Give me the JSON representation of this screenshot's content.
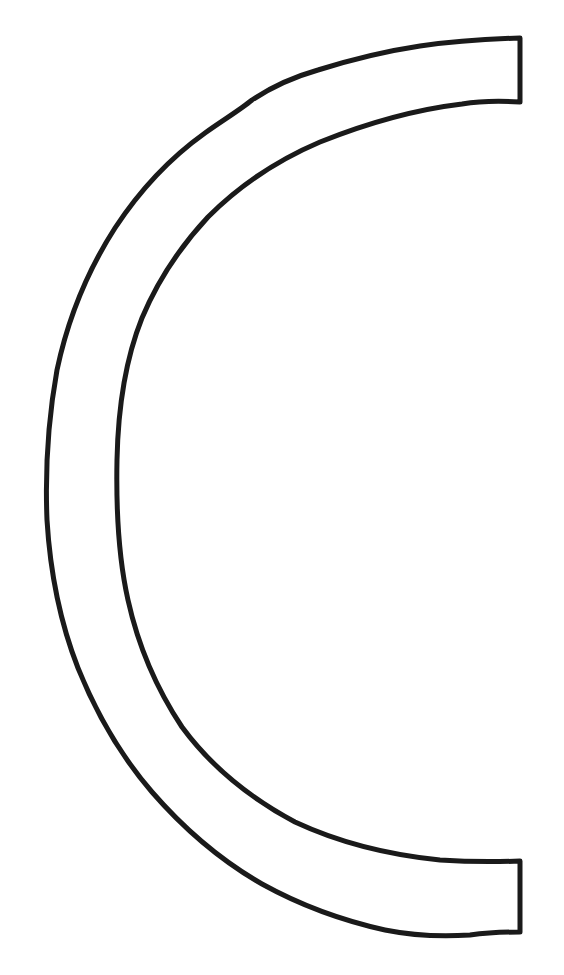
{
  "figure": {
    "description": "Outlined C-shaped semicircular band (coloring-page style line art)",
    "shape": "c-shape-band",
    "stroke_color": "#1a1a1a",
    "fill_color": "#ffffff",
    "background_color": "#ffffff",
    "stroke_width": 5,
    "outer_top_corner": [
      520,
      38
    ],
    "outer_bottom_corner": [
      520,
      932
    ],
    "inner_top_corner": [
      520,
      100
    ],
    "inner_bottom_corner": [
      520,
      862
    ]
  }
}
